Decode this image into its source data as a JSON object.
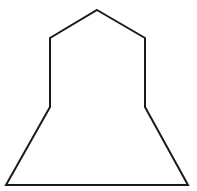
{
  "figure": {
    "shape": "heptagon-bell",
    "stroke_color": "#1a1a1a",
    "fill_color": "#ffffff",
    "stroke_width": 2,
    "points": "97,10 145,38 145,107 188,185 6,185 50,107 50,38"
  }
}
